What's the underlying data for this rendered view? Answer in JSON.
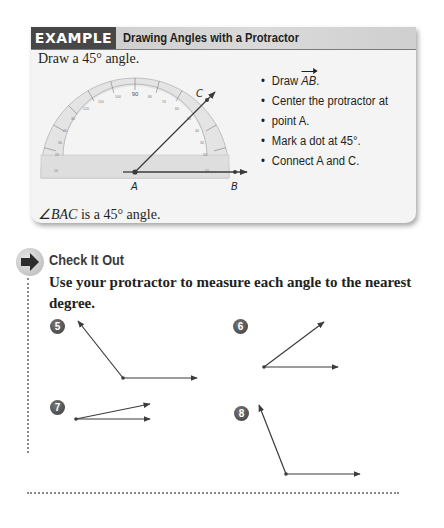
{
  "example": {
    "tag": "EXAMPLE",
    "title": "Drawing Angles with a Protractor",
    "prompt": "Draw a 45° angle.",
    "steps": [
      {
        "prefix": "Draw ",
        "ray": "AB",
        "suffix": "."
      },
      {
        "text": "Center the protractor at"
      },
      {
        "text": "point A."
      },
      {
        "text": "Mark a dot at 45°."
      },
      {
        "text": "Connect A and C."
      }
    ],
    "figure": {
      "point_labels": {
        "a": "A",
        "b": "B",
        "c": "C"
      },
      "protractor_top_label": "90",
      "angle_degrees": 45
    },
    "conclusion_angle": "∠BAC",
    "conclusion_rest": " is a 45° angle."
  },
  "check_it_out": {
    "title": "Check It Out",
    "instruction": "Use your protractor to measure each angle to the nearest degree.",
    "problems": [
      {
        "number": "5"
      },
      {
        "number": "6"
      },
      {
        "number": "7"
      },
      {
        "number": "8"
      }
    ]
  },
  "colors": {
    "tag_bg": "#474747",
    "header_bg": "#d4d4d4",
    "box_bg": "#f4f4f4",
    "ink": "#231f20",
    "protractor_fill": "#e2e2e2"
  }
}
